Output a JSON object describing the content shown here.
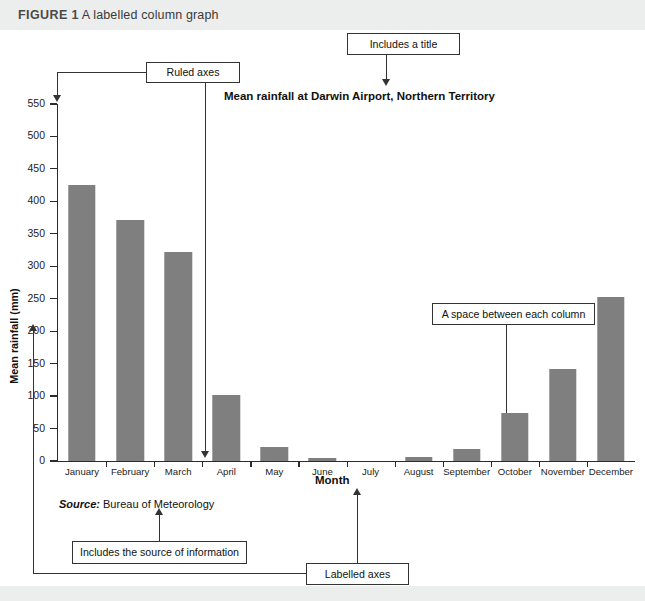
{
  "figure": {
    "label": "FIGURE 1",
    "caption": "A labelled column graph"
  },
  "chart_data": {
    "type": "bar",
    "title": "Mean rainfall at Darwin Airport, Northern Territory",
    "xlabel": "Month",
    "ylabel": "Mean rainfall (mm)",
    "categories": [
      "January",
      "February",
      "March",
      "April",
      "May",
      "June",
      "July",
      "August",
      "September",
      "October",
      "November",
      "December"
    ],
    "values": [
      425,
      372,
      322,
      101,
      22,
      4,
      0,
      6,
      19,
      74,
      142,
      253
    ],
    "ylim": [
      0,
      550
    ],
    "ytick_step": 50,
    "yticks": [
      0,
      50,
      100,
      150,
      200,
      250,
      300,
      350,
      400,
      450,
      500,
      550
    ],
    "grid": false,
    "legend": null,
    "bar_color": "#7f7f7f",
    "axis_color": "#2b2b2b",
    "source_label": "Source:",
    "source_value": "Bureau of Meteorology"
  },
  "annotations": {
    "ruled_axes": "Ruled axes",
    "includes_title": "Includes a title",
    "space_between": "A space between each column",
    "source_info": "Includes the source of information",
    "labelled_axes": "Labelled axes"
  }
}
